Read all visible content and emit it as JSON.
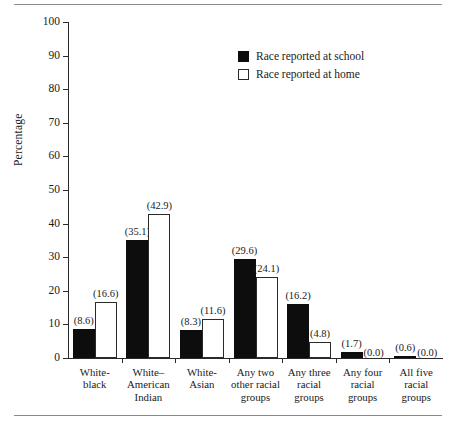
{
  "chart_data": {
    "type": "bar",
    "title": "",
    "xlabel": "",
    "ylabel": "Percentage",
    "ylim": [
      0,
      100
    ],
    "yticks": [
      0,
      10,
      20,
      30,
      40,
      50,
      60,
      70,
      80,
      90,
      100
    ],
    "grid": false,
    "legend_position": "upper-right",
    "categories": [
      "White-\nblack",
      "White–\nAmerican\nIndian",
      "White-\nAsian",
      "Any two\nother racial\ngroups",
      "Any three\nracial\ngroups",
      "Any four\nracial\ngroups",
      "All five\nracial\ngroups"
    ],
    "series": [
      {
        "name": "Race reported at school",
        "color": "#0d0d0d",
        "values": [
          8.6,
          35.1,
          8.3,
          29.6,
          16.2,
          1.7,
          0.6
        ],
        "labels": [
          "(8.6)",
          "(35.1)",
          "(8.3)",
          "(29.6)",
          "(16.2)",
          "(1.7)",
          "(0.6)"
        ]
      },
      {
        "name": "Race reported at home",
        "color": "#ffffff",
        "values": [
          16.6,
          42.9,
          11.6,
          24.1,
          4.8,
          0.0,
          0.0
        ],
        "labels": [
          "(16.6)",
          "(42.9)",
          "(11.6)",
          "(24.1)",
          "(4.8)",
          "(0.0)",
          "(0.0)"
        ]
      }
    ]
  },
  "legend": {
    "items": [
      {
        "label": "Race reported at school",
        "style": "filled"
      },
      {
        "label": "Race reported at home",
        "style": "open"
      }
    ]
  }
}
